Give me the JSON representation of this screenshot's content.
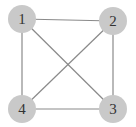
{
  "diagram": {
    "type": "graph",
    "colors": {
      "node_fill": "#c9c9c9",
      "edge": "#8a8a8a",
      "label": "#333333",
      "background": "#ffffff"
    },
    "nodes": [
      {
        "id": "1",
        "label": "1",
        "x": 22,
        "y": 19
      },
      {
        "id": "2",
        "label": "2",
        "x": 113,
        "y": 21
      },
      {
        "id": "3",
        "label": "3",
        "x": 113,
        "y": 109
      },
      {
        "id": "4",
        "label": "4",
        "x": 22,
        "y": 109
      }
    ],
    "edges": [
      {
        "from": "1",
        "to": "2"
      },
      {
        "from": "1",
        "to": "4"
      },
      {
        "from": "1",
        "to": "3"
      },
      {
        "from": "2",
        "to": "3"
      },
      {
        "from": "2",
        "to": "4"
      },
      {
        "from": "4",
        "to": "3"
      }
    ]
  }
}
